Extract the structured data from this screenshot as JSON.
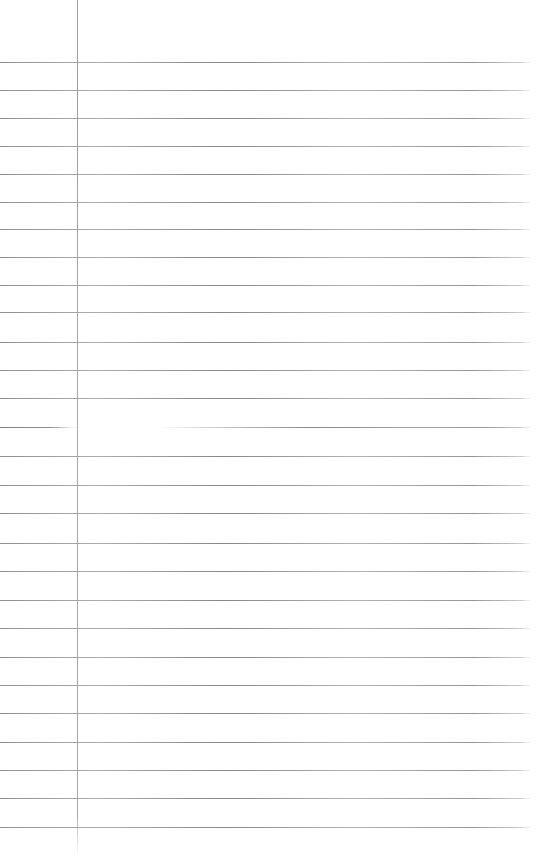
{
  "page": {
    "background_color": "#ffffff",
    "rule_color": "#8a8a8a",
    "margin_line_color": "#969696",
    "rule_line_count": 28,
    "rule_line_ys": [
      62,
      90,
      118,
      146,
      174,
      202,
      229,
      257,
      285,
      312,
      342,
      370,
      398,
      427,
      456,
      485,
      513,
      543,
      571,
      600,
      628,
      657,
      685,
      713,
      742,
      770,
      798,
      827
    ],
    "rule_right_fade_x": 531,
    "margin_line_x": 77,
    "margin_line_height": 856,
    "glare": {
      "center_x": 118,
      "center_y": 430,
      "width": 180,
      "height": 38,
      "interrupted_rule_y": 427
    }
  }
}
